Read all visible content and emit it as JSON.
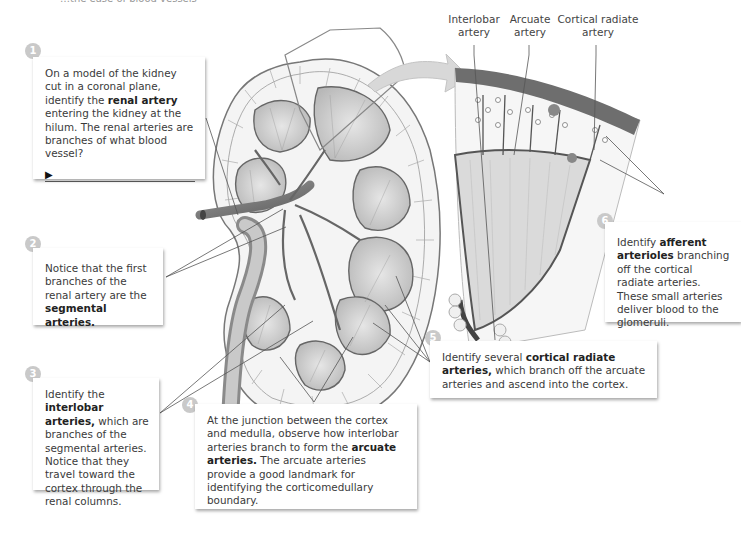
{
  "top_cutoff_text": "…the ease of blood vessels",
  "diagram": {
    "kidney_label": "kidney coronal section",
    "detail_labels": [
      {
        "line1": "Interlobar",
        "line2": "artery"
      },
      {
        "line1": "Arcuate",
        "line2": "artery"
      },
      {
        "line1": "Cortical radiate",
        "line2": "artery"
      }
    ]
  },
  "steps": [
    {
      "number": "1",
      "pre": "On a model of the kidney cut in a coronal plane, identify the ",
      "bold": "renal artery",
      "post": " entering the kidney at the hilum. The renal arteries are branches of what blood vessel?",
      "answer_prompt": "▶"
    },
    {
      "number": "2",
      "pre": "Notice that the first branches of the renal artery are the ",
      "bold": "segmental arteries.",
      "post": ""
    },
    {
      "number": "3",
      "pre": "Identify the ",
      "bold": "interlobar arteries,",
      "post": " which are branches of the segmental arteries. Notice that they travel toward the cortex through the renal columns."
    },
    {
      "number": "4",
      "pre": "At the junction between the cortex and medulla, observe how interlobar arteries branch to form the ",
      "bold": "arcuate arteries.",
      "post": " The arcuate arteries provide a good landmark for identifying the corticomedullary boundary."
    },
    {
      "number": "5",
      "pre": "Identify several ",
      "bold": "cortical radiate arteries,",
      "post": " which branch off the arcuate arteries and ascend into the cortex."
    },
    {
      "number": "6",
      "pre": "Identify ",
      "bold": "afferent arterioles",
      "post": " branching off the cortical radiate arteries. These small arteries deliver blood to the glomeruli."
    }
  ],
  "colors": {
    "badge": "#c9c9c9",
    "cortex_band": "#7a7a7a",
    "vessel": "#6a6a6a"
  }
}
